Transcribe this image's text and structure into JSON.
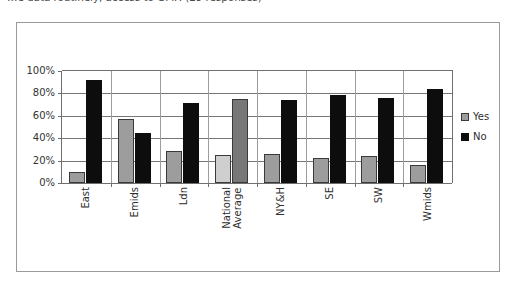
{
  "caption": "…e data routinely, access to GMP. (29 responses)",
  "chart_data": {
    "type": "bar",
    "title": "",
    "xlabel": "",
    "ylabel": "",
    "ylim": [
      0,
      100
    ],
    "ytick_labels": [
      "0%",
      "20%",
      "40%",
      "60%",
      "80%",
      "100%"
    ],
    "ytick_values": [
      0,
      20,
      40,
      60,
      80,
      100
    ],
    "grid": true,
    "legend_position": "right",
    "categories": [
      "East",
      "Emids",
      "Ldn",
      "National Average",
      "NY&H",
      "SE",
      "SW",
      "Wmids"
    ],
    "series": [
      {
        "name": "Yes",
        "color": "#9d9d9d",
        "values": [
          10,
          57,
          29,
          25,
          26,
          22,
          24,
          16
        ]
      },
      {
        "name": "No",
        "color": "#0d0d0d",
        "values": [
          92,
          45,
          71,
          75,
          74,
          79,
          76,
          84
        ]
      }
    ]
  },
  "legend": {
    "items": [
      {
        "label": "Yes",
        "swatch": "yes"
      },
      {
        "label": "No",
        "swatch": "no"
      }
    ]
  },
  "colors": {
    "yes_bar": "#9d9d9d",
    "no_bar": "#0d0d0d",
    "national_yes_bar": "#cfcfcf",
    "national_no_bar": "#787878",
    "gridline": "#777777",
    "axis": "#6f6f6f",
    "frame_border": "#9a9a9a",
    "background": "#ffffff"
  }
}
